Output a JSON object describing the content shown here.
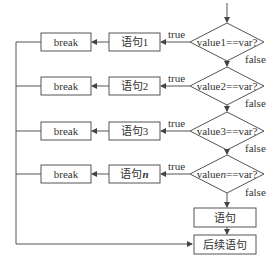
{
  "diagram": {
    "type": "flowchart",
    "rows": [
      {
        "condition": "value1==var?",
        "statement": "语句1",
        "break_label": "break",
        "true_label": "true",
        "false_label": "false"
      },
      {
        "condition": "value2==var?",
        "statement": "语句2",
        "break_label": "break",
        "true_label": "true",
        "false_label": "false"
      },
      {
        "condition": "value3==var?",
        "statement": "语句3",
        "break_label": "break",
        "true_label": "true",
        "false_label": "false"
      },
      {
        "condition_prefix": "value",
        "condition_var": "n",
        "condition_suffix": "==var?",
        "statement_prefix": "语句",
        "statement_var": "n",
        "break_label": "break",
        "true_label": "true",
        "false_label": "false"
      }
    ],
    "default_statement": "语句",
    "next_statement": "后续语句",
    "colors": {
      "line": "#444444",
      "text": "#333333",
      "background": "#ffffff"
    }
  }
}
